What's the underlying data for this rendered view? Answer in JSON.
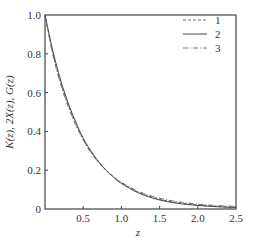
{
  "chart_data": {
    "type": "line",
    "title": "",
    "xlabel": "z",
    "ylabel": "K(z), 2X(z), G(z)",
    "xlim": [
      0,
      2.5
    ],
    "ylim": [
      0,
      1.0
    ],
    "xticks": [
      0.5,
      1.0,
      1.5,
      2.0,
      2.5
    ],
    "xtick_labels": [
      "0.5",
      "1.0",
      "1.5",
      "2.0",
      "2.5"
    ],
    "yticks": [
      0,
      0.2,
      0.4,
      0.6,
      0.8,
      1.0
    ],
    "ytick_labels": [
      "0",
      "0.2",
      "0.4",
      "0.6",
      "0.8",
      "1.0"
    ],
    "grid": false,
    "legend_position": "upper right",
    "x": [
      0,
      0.1,
      0.2,
      0.3,
      0.4,
      0.5,
      0.6,
      0.7,
      0.8,
      0.9,
      1.0,
      1.2,
      1.4,
      1.6,
      1.8,
      2.0,
      2.2,
      2.4,
      2.5
    ],
    "series": [
      {
        "name": "1",
        "style": "dashed",
        "values": [
          1.0,
          0.81,
          0.66,
          0.54,
          0.44,
          0.36,
          0.295,
          0.24,
          0.2,
          0.165,
          0.135,
          0.09,
          0.062,
          0.042,
          0.03,
          0.021,
          0.015,
          0.011,
          0.01
        ]
      },
      {
        "name": "2",
        "style": "solid",
        "values": [
          1.0,
          0.82,
          0.67,
          0.55,
          0.45,
          0.365,
          0.3,
          0.245,
          0.2,
          0.163,
          0.132,
          0.087,
          0.057,
          0.038,
          0.026,
          0.018,
          0.013,
          0.009,
          0.008
        ]
      },
      {
        "name": "3",
        "style": "dash-dot",
        "values": [
          1.0,
          0.8,
          0.65,
          0.53,
          0.435,
          0.355,
          0.29,
          0.24,
          0.198,
          0.165,
          0.138,
          0.095,
          0.066,
          0.047,
          0.034,
          0.025,
          0.019,
          0.015,
          0.013
        ]
      }
    ]
  },
  "legend": [
    {
      "label": "1"
    },
    {
      "label": "2"
    },
    {
      "label": "3"
    }
  ],
  "axes": {
    "xlabel": "z",
    "ylabel": "K(z), 2X(z), G(z)",
    "xtick_labels": [
      "0.5",
      "1.0",
      "1.5",
      "2.0",
      "2.5"
    ],
    "ytick_labels": [
      "0",
      "0.2",
      "0.4",
      "0.6",
      "0.8",
      "1.0"
    ]
  }
}
